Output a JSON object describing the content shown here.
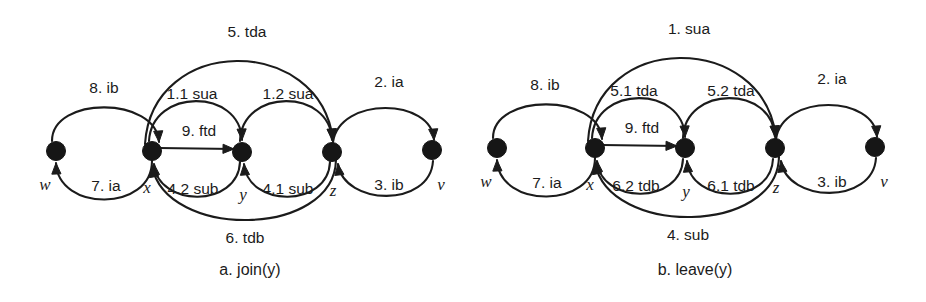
{
  "figure": {
    "background_color": "#ffffff",
    "ink_color": "#1b1b1b",
    "panels": [
      {
        "id": "a",
        "caption": "a.   join(y)",
        "caption_x": 250,
        "caption_y": 275,
        "nodes": [
          {
            "id": "w",
            "label": "w",
            "cx": 56,
            "cy": 151,
            "r": 9.5,
            "label_x": 45,
            "label_y": 190
          },
          {
            "id": "x",
            "label": "x",
            "cx": 152,
            "cy": 151,
            "r": 9.5,
            "label_x": 147,
            "label_y": 193
          },
          {
            "id": "y",
            "label": "y",
            "cx": 242,
            "cy": 152,
            "r": 9.5,
            "label_x": 243,
            "label_y": 200
          },
          {
            "id": "z",
            "label": "z",
            "cx": 332,
            "cy": 152,
            "r": 9.5,
            "label_x": 333,
            "label_y": 196
          },
          {
            "id": "v",
            "label": "v",
            "cx": 432,
            "cy": 150,
            "r": 9.5,
            "label_x": 441,
            "label_y": 190
          }
        ],
        "edges": [
          {
            "id": "a-8-ib",
            "label": "8. ib",
            "from": "w",
            "to": "x",
            "label_x": 104,
            "label_y": 93,
            "path": "M 52 141 C 52 96 156 96 159 142",
            "arrow_at": [
              159,
              142
            ],
            "arrow_angle": 86
          },
          {
            "id": "a-7-ia",
            "label": "7. ia",
            "from": "x",
            "to": "w",
            "label_x": 106,
            "label_y": 191,
            "path": "M 152 161 C 152 212 58 212 56 163",
            "arrow_at": [
              56,
              163
            ],
            "arrow_angle": 268
          },
          {
            "id": "a-1-1-sua",
            "label": "1.1 sua",
            "from": "x",
            "to": "y",
            "label_x": 192,
            "label_y": 99,
            "path": "M 149 141 C 152 88 240 88 242 140",
            "arrow_at": [
              242,
              140
            ],
            "arrow_angle": 88
          },
          {
            "id": "a-1-2-sua",
            "label": "1.2 sua",
            "from": "y",
            "to": "z",
            "label_x": 288,
            "label_y": 99,
            "path": "M 240 141 C 242 88 330 88 332 140",
            "arrow_at": [
              332,
              140
            ],
            "arrow_angle": 88
          },
          {
            "id": "a-5-tda",
            "label": "5. tda",
            "from": "x",
            "to": "z",
            "label_x": 247,
            "label_y": 37,
            "path": "M 145 144 C 152 34 320 34 333 140",
            "arrow_at": [
              333,
              140
            ],
            "arrow_angle": 84
          },
          {
            "id": "a-4-2-sub",
            "label": "4.2 sub",
            "from": "y",
            "to": "x",
            "label_x": 193,
            "label_y": 194,
            "path": "M 240 162 C 238 208 158 208 154 164",
            "arrow_at": [
              154,
              164
            ],
            "arrow_angle": 265
          },
          {
            "id": "a-4-1-sub",
            "label": "4.1 sub",
            "from": "z",
            "to": "y",
            "label_x": 288,
            "label_y": 194,
            "path": "M 330 162 C 328 208 248 208 244 164",
            "arrow_at": [
              244,
              164
            ],
            "arrow_angle": 265
          },
          {
            "id": "a-6-tdb",
            "label": "6. tdb",
            "from": "z",
            "to": "x",
            "label_x": 245,
            "label_y": 243,
            "path": "M 336 160 C 334 238 166 240 152 166",
            "arrow_at": [
              152,
              166
            ],
            "arrow_angle": 260
          },
          {
            "id": "a-9-ftd",
            "label": "9. ftd",
            "from": "x",
            "to": "y",
            "label_x": 199,
            "label_y": 136,
            "path": "M 159 148 L 234 149",
            "arrow_at": [
              234,
              149
            ],
            "arrow_angle": 1
          },
          {
            "id": "a-2-ia",
            "label": "2. ia",
            "from": "z",
            "to": "v",
            "label_x": 389,
            "label_y": 87,
            "path": "M 333 142 C 340 96 432 98 434 140",
            "arrow_at": [
              434,
              140
            ],
            "arrow_angle": 86
          },
          {
            "id": "a-3-ib",
            "label": "3. ib",
            "from": "v",
            "to": "z",
            "label_x": 389,
            "label_y": 190,
            "path": "M 433 161 C 430 208 344 206 338 164",
            "arrow_at": [
              338,
              164
            ],
            "arrow_angle": 263
          }
        ]
      },
      {
        "id": "b",
        "caption": "b.   leave(y)",
        "caption_x": 232,
        "caption_y": 275,
        "nodes": [
          {
            "id": "w",
            "label": "w",
            "cx": 34,
            "cy": 148,
            "r": 9.5,
            "label_x": 23,
            "label_y": 187
          },
          {
            "id": "x",
            "label": "x",
            "cx": 132,
            "cy": 148,
            "r": 9.5,
            "label_x": 127,
            "label_y": 190
          },
          {
            "id": "y",
            "label": "y",
            "cx": 222,
            "cy": 148,
            "r": 9.5,
            "label_x": 223,
            "label_y": 197
          },
          {
            "id": "z",
            "label": "z",
            "cx": 312,
            "cy": 148,
            "r": 9.5,
            "label_x": 313,
            "label_y": 193
          },
          {
            "id": "v",
            "label": "v",
            "cx": 412,
            "cy": 147,
            "r": 9.5,
            "label_x": 421,
            "label_y": 187
          }
        ],
        "edges": [
          {
            "id": "b-8-ib",
            "label": "8. ib",
            "from": "w",
            "to": "x",
            "label_x": 82,
            "label_y": 90,
            "path": "M 30 138 C 30 93 136 93 139 139",
            "arrow_at": [
              139,
              139
            ],
            "arrow_angle": 86
          },
          {
            "id": "b-7-ia",
            "label": "7. ia",
            "from": "x",
            "to": "w",
            "label_x": 84,
            "label_y": 188,
            "path": "M 132 158 C 132 209 36 209 34 160",
            "arrow_at": [
              34,
              160
            ],
            "arrow_angle": 268
          },
          {
            "id": "b-5-1-tda",
            "label": "5.1 tda",
            "from": "x",
            "to": "y",
            "label_x": 171,
            "label_y": 96,
            "path": "M 129 138 C 132 85 220 85 222 137",
            "arrow_at": [
              222,
              137
            ],
            "arrow_angle": 88
          },
          {
            "id": "b-5-2-tda",
            "label": "5.2 tda",
            "from": "y",
            "to": "z",
            "label_x": 268,
            "label_y": 96,
            "path": "M 220 138 C 222 85 310 85 312 137",
            "arrow_at": [
              312,
              137
            ],
            "arrow_angle": 88
          },
          {
            "id": "b-1-sua",
            "label": "1. sua",
            "from": "x",
            "to": "z",
            "label_x": 226,
            "label_y": 34,
            "path": "M 125 141 C 132 31 300 31 313 137",
            "arrow_at": [
              313,
              137
            ],
            "arrow_angle": 84
          },
          {
            "id": "b-6-2-tdb",
            "label": "6.2 tdb",
            "from": "y",
            "to": "x",
            "label_x": 173,
            "label_y": 191,
            "path": "M 220 159 C 218 205 138 205 134 161",
            "arrow_at": [
              134,
              161
            ],
            "arrow_angle": 265
          },
          {
            "id": "b-6-1-tdb",
            "label": "6.1 tdb",
            "from": "z",
            "to": "y",
            "label_x": 268,
            "label_y": 191,
            "path": "M 310 159 C 308 205 228 205 224 161",
            "arrow_at": [
              224,
              161
            ],
            "arrow_angle": 265
          },
          {
            "id": "b-4-sub",
            "label": "4. sub",
            "from": "z",
            "to": "x",
            "label_x": 225,
            "label_y": 240,
            "path": "M 316 157 C 314 235 146 237 132 163",
            "arrow_at": [
              132,
              163
            ],
            "arrow_angle": 260
          },
          {
            "id": "b-9-ftd",
            "label": "9. ftd",
            "from": "x",
            "to": "y",
            "label_x": 179,
            "label_y": 133,
            "path": "M 139 145 L 214 146",
            "arrow_at": [
              214,
              146
            ],
            "arrow_angle": 1
          },
          {
            "id": "b-2-ia",
            "label": "2. ia",
            "from": "z",
            "to": "v",
            "label_x": 369,
            "label_y": 84,
            "path": "M 313 139 C 320 93 412 95 414 137",
            "arrow_at": [
              414,
              137
            ],
            "arrow_angle": 86
          },
          {
            "id": "b-3-ib",
            "label": "3. ib",
            "from": "v",
            "to": "z",
            "label_x": 369,
            "label_y": 187,
            "path": "M 413 158 C 410 205 324 203 318 161",
            "arrow_at": [
              318,
              161
            ],
            "arrow_angle": 263
          }
        ]
      }
    ]
  }
}
